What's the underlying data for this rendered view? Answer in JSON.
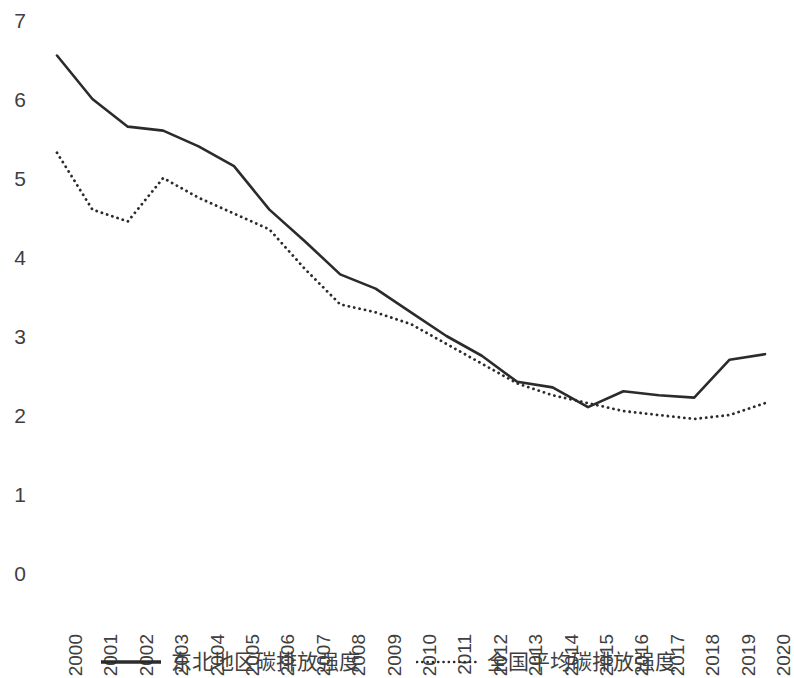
{
  "chart_data": {
    "type": "line",
    "title": "",
    "subtitle": "",
    "xlabel": "",
    "ylabel": "",
    "grid": false,
    "legend_position": "bottom",
    "xlim": [
      2000,
      2020
    ],
    "ylim": [
      0,
      7
    ],
    "y_ticks": [
      "7",
      "6",
      "5",
      "4",
      "3",
      "2",
      "1",
      "0"
    ],
    "y_tick_values": [
      7,
      6,
      5,
      4,
      3,
      2,
      1,
      0
    ],
    "categories": [
      "2000",
      "2001",
      "2002",
      "2003",
      "2004",
      "2005",
      "2006",
      "2007",
      "2008",
      "2009",
      "2010",
      "2011",
      "2012",
      "2013",
      "2014",
      "2015",
      "2016",
      "2017",
      "2018",
      "2019",
      "2020"
    ],
    "series": [
      {
        "name": "东北地区碳排放强度",
        "style": "solid",
        "color": "#2b2b2b",
        "width": 2.6,
        "values": [
          6.55,
          6.0,
          5.65,
          5.6,
          5.4,
          5.15,
          4.6,
          4.2,
          3.78,
          3.6,
          3.3,
          3.0,
          2.75,
          2.42,
          2.35,
          2.1,
          2.3,
          2.25,
          2.22,
          2.7,
          2.77
        ]
      },
      {
        "name": "全国平均碳排放强度",
        "style": "dotted",
        "color": "#2b2b2b",
        "width": 2.6,
        "values": [
          5.32,
          4.6,
          4.45,
          5.0,
          4.75,
          4.55,
          4.35,
          3.85,
          3.4,
          3.3,
          3.15,
          2.9,
          2.65,
          2.4,
          2.25,
          2.15,
          2.05,
          2.0,
          1.95,
          2.0,
          2.15
        ]
      }
    ]
  },
  "legend": {
    "entries": [
      {
        "label": "东北地区碳排放强度",
        "style": "solid"
      },
      {
        "label": "全国平均碳排放强度",
        "style": "dotted"
      }
    ]
  }
}
